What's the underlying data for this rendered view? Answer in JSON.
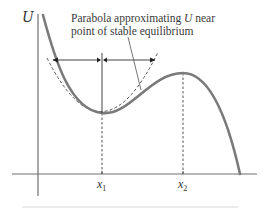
{
  "diagram": {
    "axis": {
      "y_label": "U",
      "x_ticks": [
        {
          "var": "x",
          "sub": "1",
          "x": 102
        },
        {
          "var": "x",
          "sub": "2",
          "x": 183
        }
      ]
    },
    "annotation": {
      "line1_pre": "Parabola approximating ",
      "line1_var": "U",
      "line1_post": " near",
      "line2": "point of stable equilibrium"
    },
    "colors": {
      "curve": "#7a7a7a",
      "axis": "#6e6e6e",
      "dashed": "#555555",
      "arrow": "#333333",
      "text": "#333333"
    },
    "features": {
      "stable_equilibrium": {
        "label_x": "x1",
        "type": "minimum"
      },
      "unstable_equilibrium": {
        "label_x": "x2",
        "type": "maximum"
      }
    }
  }
}
